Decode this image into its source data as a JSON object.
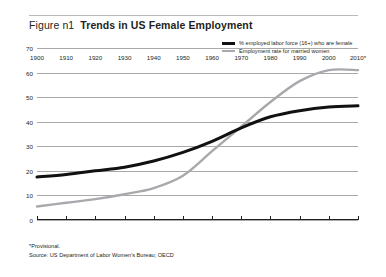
{
  "header": {
    "figure_number": "Figure n1",
    "title": "Trends in US Female Employment"
  },
  "footnotes": {
    "provisional": "*Provisional.",
    "source": "Source: US Department of Labor Women's Bureau; OECD"
  },
  "colors": {
    "series_black": "#111111",
    "series_gray": "#a7a9ac",
    "grid": "#a9a9a9",
    "axis": "#231f20",
    "text": "#231f20",
    "background": "#ffffff"
  },
  "chart_data": {
    "type": "line",
    "title": "Trends in US Female Employment",
    "xlabel": "",
    "ylabel": "",
    "xlim": [
      1900,
      2010
    ],
    "ylim": [
      0,
      70
    ],
    "yticks": [
      0,
      10,
      20,
      30,
      40,
      50,
      60,
      70
    ],
    "ytick_labels": [
      "0",
      "10",
      "20",
      "30",
      "40",
      "50",
      "60",
      "70"
    ],
    "grid": true,
    "legend_position": "top-right",
    "categories": [
      "1900",
      "1910",
      "1920",
      "1930",
      "1940",
      "1950",
      "1960",
      "1970",
      "1980",
      "1990",
      "2000",
      "2010*"
    ],
    "x": [
      1900,
      1910,
      1920,
      1930,
      1940,
      1950,
      1960,
      1970,
      1980,
      1990,
      2000,
      2010
    ],
    "series": [
      {
        "name": "% employed labor force (16+) who are female",
        "color": "#111111",
        "values": [
          17.5,
          18.5,
          20.0,
          21.5,
          24.0,
          27.5,
          32.0,
          37.5,
          42.0,
          44.5,
          46.0,
          46.5
        ]
      },
      {
        "name": "Employment rate for married women",
        "color": "#a7a9ac",
        "values": [
          5.5,
          7.0,
          8.5,
          10.5,
          13.0,
          18.0,
          28.0,
          38.0,
          48.0,
          56.5,
          61.0,
          61.0
        ]
      }
    ]
  }
}
